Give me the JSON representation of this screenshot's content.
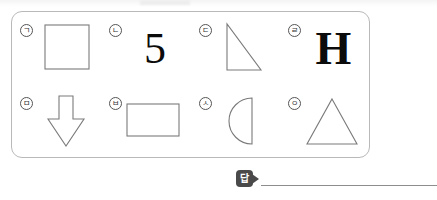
{
  "page": {
    "type": "worksheet-question",
    "border_color": "#b9b9b9",
    "shape_stroke_color": "#7a7a7a",
    "badge_color": "#4a4a4a"
  },
  "choices": [
    {
      "marker": "ㄱ",
      "kind": "shape",
      "shape": "square",
      "name": "square-shape"
    },
    {
      "marker": "ㄴ",
      "kind": "text",
      "text": "5",
      "name": "digit-five"
    },
    {
      "marker": "ㄷ",
      "kind": "shape",
      "shape": "right-triangle",
      "name": "right-triangle-shape"
    },
    {
      "marker": "ㄹ",
      "kind": "text",
      "text": "H",
      "name": "letter-h"
    },
    {
      "marker": "ㅁ",
      "kind": "shape",
      "shape": "down-arrow",
      "name": "down-arrow-shape"
    },
    {
      "marker": "ㅂ",
      "kind": "shape",
      "shape": "rectangle",
      "name": "rectangle-shape"
    },
    {
      "marker": "ㅅ",
      "kind": "shape",
      "shape": "half-circle",
      "name": "half-circle-shape"
    },
    {
      "marker": "ㅇ",
      "kind": "shape",
      "shape": "triangle",
      "name": "triangle-shape"
    }
  ],
  "answer": {
    "label": "답",
    "value": ""
  }
}
